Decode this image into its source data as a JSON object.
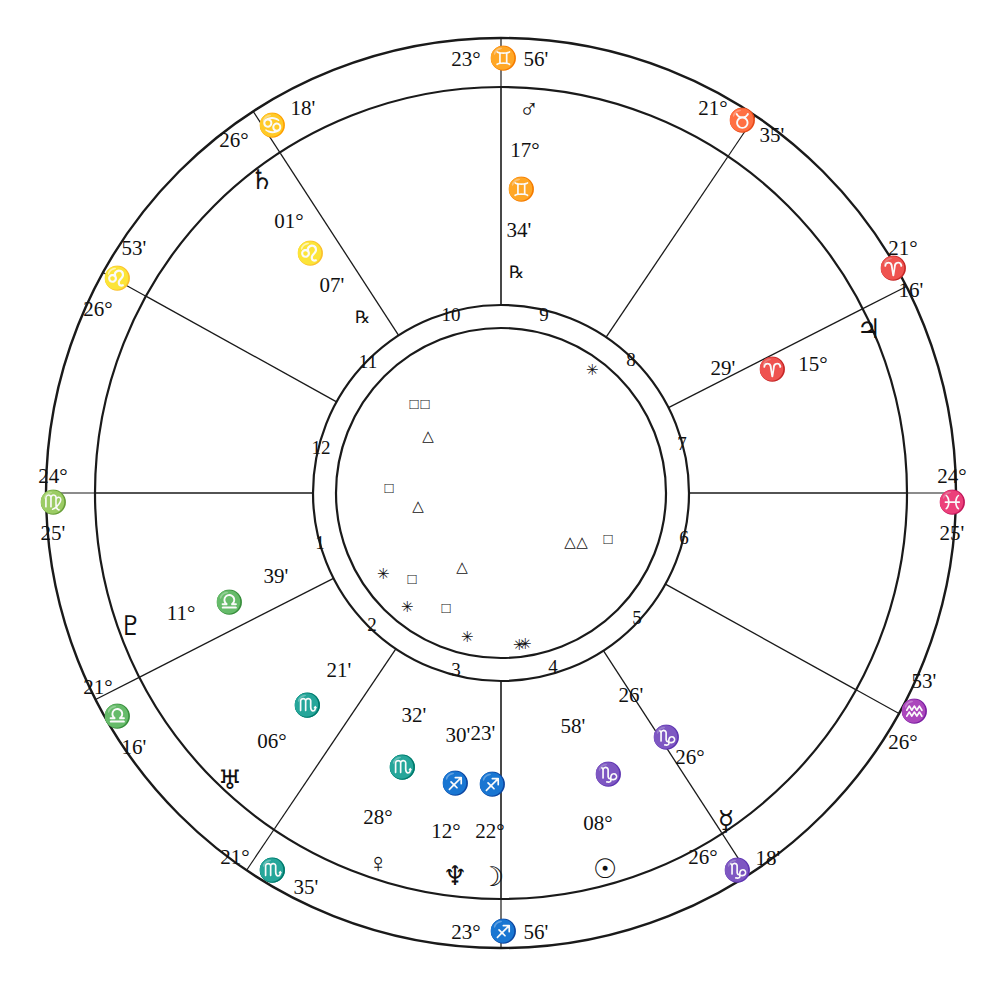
{
  "chart": {
    "type": "astrological-wheel",
    "house_system": "quadrant",
    "stroke_color": "#1a1a1a",
    "background": "#ffffff",
    "degree_symbol": "°",
    "minute_symbol": "'",
    "retrograde_symbol": "℞"
  },
  "signs": {
    "aries": "♈",
    "taurus": "♉",
    "gemini": "♊",
    "cancer": "♋",
    "leo": "♌",
    "virgo": "♍",
    "libra": "♎",
    "scorpio": "♏",
    "sagittarius": "♐",
    "capricorn": "♑",
    "aquarius": "♒",
    "pisces": "♓"
  },
  "planet_glyphs": {
    "sun": "☉",
    "moon": "☽",
    "mercury": "☿",
    "venus": "♀",
    "mars": "♂",
    "jupiter": "♃",
    "saturn": "♄",
    "uranus": "♅",
    "neptune": "♆",
    "pluto": "♇"
  },
  "aspect_glyphs": {
    "square": "□",
    "trine": "△",
    "sextile": "✳",
    "conjunction": "○"
  },
  "cusps": [
    {
      "id": "asc",
      "house": 1,
      "deg": "24°",
      "sign": "♍",
      "min": "25'",
      "angle_deg": 180,
      "label": "24° ♍ 25'"
    },
    {
      "id": "c2",
      "house": 2,
      "deg": "21°",
      "sign": "♎",
      "min": "16'",
      "angle_deg": 207,
      "label": "21° ♎ 16'"
    },
    {
      "id": "c3",
      "house": 3,
      "deg": "21°",
      "sign": "♏",
      "min": "35'",
      "angle_deg": 236,
      "label": "21° ♏ 35'"
    },
    {
      "id": "ic",
      "house": 4,
      "deg": "23°",
      "sign": "♐",
      "min": "56'",
      "angle_deg": 270,
      "label": "23° ♐ 56'"
    },
    {
      "id": "c5",
      "house": 5,
      "deg": "26°",
      "sign": "♑",
      "min": "18'",
      "angle_deg": 303,
      "label": "26° ♑ 18'"
    },
    {
      "id": "c6",
      "house": 6,
      "deg": "26°",
      "sign": "♒",
      "min": "53'",
      "angle_deg": 331,
      "label": "26° ♒ 53'"
    },
    {
      "id": "dsc",
      "house": 7,
      "deg": "24°",
      "sign": "♓",
      "min": "25'",
      "angle_deg": 0,
      "label": "24° ♓ 25'"
    },
    {
      "id": "c8",
      "house": 8,
      "deg": "21°",
      "sign": "♈",
      "min": "16'",
      "angle_deg": 27,
      "label": "21° ♈ 16'"
    },
    {
      "id": "c9",
      "house": 9,
      "deg": "21°",
      "sign": "♉",
      "min": "35'",
      "angle_deg": 56,
      "label": "21° ♉ 35'"
    },
    {
      "id": "mc",
      "house": 10,
      "deg": "23°",
      "sign": "♊",
      "min": "56'",
      "angle_deg": 90,
      "label": "23° ♊ 56'"
    },
    {
      "id": "c11",
      "house": 11,
      "deg": "26°",
      "sign": "♋",
      "min": "18'",
      "angle_deg": 123,
      "label": "26° ♋ 18'"
    },
    {
      "id": "c12",
      "house": 12,
      "deg": "26°",
      "sign": "♌",
      "min": "53'",
      "angle_deg": 151,
      "label": "26° ♌ 53'"
    }
  ],
  "planets": [
    {
      "id": "mars",
      "name": "Mars",
      "glyph": "♂",
      "deg": "17°",
      "sign": "♊",
      "min": "34'",
      "retrograde": true,
      "rx": "℞",
      "x": 529,
      "y": 112,
      "label": "Mars 17° ♊ 34' ℞"
    },
    {
      "id": "saturn",
      "name": "Saturn",
      "glyph": "♄",
      "deg": "01°",
      "sign": "♌",
      "min": "07'",
      "retrograde": true,
      "rx": "℞",
      "x": 262,
      "y": 183,
      "label": "Saturn 01° ♌ 07' ℞"
    },
    {
      "id": "jupiter",
      "name": "Jupiter",
      "glyph": "♃",
      "deg": "15°",
      "sign": "♈",
      "min": "29'",
      "retrograde": false,
      "rx": "",
      "x": 869,
      "y": 332,
      "label": "Jupiter 15° ♈ 29'"
    },
    {
      "id": "pluto",
      "name": "Pluto",
      "glyph": "♇",
      "deg": "11°",
      "sign": "♎",
      "min": "39'",
      "retrograde": false,
      "rx": "",
      "x": 131,
      "y": 629,
      "label": "Pluto 11° ♎ 39'"
    },
    {
      "id": "uranus",
      "name": "Uranus",
      "glyph": "♅",
      "deg": "06°",
      "sign": "♏",
      "min": "21'",
      "retrograde": false,
      "rx": "",
      "x": 230,
      "y": 783,
      "label": "Uranus 06° ♏ 21'"
    },
    {
      "id": "venus",
      "name": "Venus",
      "glyph": "♀",
      "deg": "28°",
      "sign": "♏",
      "min": "32'",
      "retrograde": false,
      "rx": "",
      "x": 378,
      "y": 866,
      "label": "Venus 28° ♏ 32'"
    },
    {
      "id": "neptune",
      "name": "Neptune",
      "glyph": "♆",
      "deg": "12°",
      "sign": "♐",
      "min": "30'",
      "retrograde": false,
      "rx": "",
      "x": 455,
      "y": 879,
      "label": "Neptune 12° ♐ 30'"
    },
    {
      "id": "moon",
      "name": "Moon",
      "glyph": "☽",
      "deg": "22°",
      "sign": "♐",
      "min": "23'",
      "retrograde": false,
      "rx": "",
      "x": 492,
      "y": 880,
      "label": "Moon 22° ♐ 23'"
    },
    {
      "id": "sun",
      "name": "Sun",
      "glyph": "☉",
      "deg": "08°",
      "sign": "♑",
      "min": "58'",
      "retrograde": false,
      "rx": "",
      "x": 605,
      "y": 872,
      "label": "Sun 08° ♑ 58'"
    },
    {
      "id": "mercury",
      "name": "Mercury",
      "glyph": "☿",
      "deg": "26°",
      "sign": "♑",
      "min": "26'",
      "retrograde": false,
      "rx": "",
      "x": 726,
      "y": 824,
      "label": "Mercury 26° ♑ 26'"
    }
  ],
  "planet_text_blocks": [
    {
      "for": "mars",
      "glyph_x": 529,
      "glyph_y": 112,
      "deg_x": 525,
      "deg_y": 152,
      "sign_x": 521,
      "sign_y": 192,
      "min_x": 519,
      "min_y": 232,
      "rx_x": 516,
      "rx_y": 274
    },
    {
      "for": "saturn",
      "glyph_x": 262,
      "glyph_y": 183,
      "deg_x": 289,
      "deg_y": 223,
      "sign_x": 310,
      "sign_y": 256,
      "min_x": 332,
      "min_y": 287,
      "rx_x": 362,
      "rx_y": 319
    },
    {
      "for": "jupiter",
      "glyph_x": 869,
      "glyph_y": 332,
      "deg_x": 813,
      "deg_y": 366,
      "sign_x": 772,
      "sign_y": 372,
      "min_x": 723,
      "min_y": 370,
      "rx_x": 0,
      "rx_y": 0
    },
    {
      "for": "pluto",
      "glyph_x": 131,
      "glyph_y": 629,
      "deg_x": 181,
      "deg_y": 615,
      "sign_x": 229,
      "sign_y": 605,
      "min_x": 276,
      "min_y": 578,
      "rx_x": 0,
      "rx_y": 0
    },
    {
      "for": "uranus",
      "glyph_x": 230,
      "glyph_y": 783,
      "deg_x": 272,
      "deg_y": 743,
      "sign_x": 307,
      "sign_y": 708,
      "min_x": 339,
      "min_y": 672,
      "rx_x": 0,
      "rx_y": 0
    },
    {
      "for": "venus",
      "glyph_x": 378,
      "glyph_y": 866,
      "deg_x": 378,
      "deg_y": 819,
      "sign_x": 402,
      "sign_y": 770,
      "min_x": 414,
      "min_y": 717,
      "rx_x": 0,
      "rx_y": 0
    },
    {
      "for": "neptune",
      "glyph_x": 455,
      "glyph_y": 879,
      "deg_x": 446,
      "deg_y": 833,
      "sign_x": 455,
      "sign_y": 786,
      "min_x": 458,
      "min_y": 737,
      "rx_x": 0,
      "rx_y": 0
    },
    {
      "for": "moon",
      "glyph_x": 492,
      "glyph_y": 880,
      "deg_x": 490,
      "deg_y": 833,
      "sign_x": 492,
      "sign_y": 787,
      "min_x": 483,
      "min_y": 735,
      "rx_x": 0,
      "rx_y": 0
    },
    {
      "for": "sun",
      "glyph_x": 605,
      "glyph_y": 872,
      "deg_x": 598,
      "deg_y": 825,
      "sign_x": 608,
      "sign_y": 777,
      "min_x": 573,
      "min_y": 728,
      "rx_x": 0,
      "rx_y": 0
    },
    {
      "for": "mercury",
      "glyph_x": 726,
      "glyph_y": 824,
      "deg_x": 690,
      "deg_y": 759,
      "sign_x": 666,
      "sign_y": 740,
      "min_x": 631,
      "min_y": 697,
      "rx_x": 0,
      "rx_y": 0
    }
  ],
  "cusp_text_blocks": [
    {
      "for": "asc",
      "deg_x": 53,
      "deg_y": 478,
      "sign_x": 53,
      "sign_y": 505,
      "min_x": 53,
      "min_y": 535
    },
    {
      "for": "dsc",
      "deg_x": 952,
      "deg_y": 478,
      "sign_x": 952,
      "sign_y": 505,
      "min_x": 952,
      "min_y": 535
    },
    {
      "for": "mc",
      "deg_x": 466,
      "deg_y": 61,
      "sign_x": 503,
      "sign_y": 61,
      "min_x": 536,
      "min_y": 61
    },
    {
      "for": "ic",
      "deg_x": 466,
      "deg_y": 934,
      "sign_x": 503,
      "sign_y": 934,
      "min_x": 536,
      "min_y": 934
    },
    {
      "for": "c11",
      "deg_x": 234,
      "deg_y": 142,
      "sign_x": 272,
      "sign_y": 128,
      "min_x": 303,
      "min_y": 110
    },
    {
      "for": "c12",
      "deg_x": 98,
      "deg_y": 311,
      "sign_x": 117,
      "sign_y": 281,
      "min_x": 134,
      "min_y": 250
    },
    {
      "for": "c2",
      "deg_x": 98,
      "deg_y": 689,
      "sign_x": 117,
      "sign_y": 719,
      "min_x": 134,
      "min_y": 749
    },
    {
      "for": "c3",
      "deg_x": 235,
      "deg_y": 859,
      "sign_x": 272,
      "sign_y": 873,
      "min_x": 306,
      "min_y": 889
    },
    {
      "for": "c5",
      "deg_x": 703,
      "deg_y": 859,
      "sign_x": 737,
      "sign_y": 873,
      "min_x": 768,
      "min_y": 860
    },
    {
      "for": "c6",
      "deg_x": 903,
      "deg_y": 744,
      "sign_x": 914,
      "sign_y": 714,
      "min_x": 924,
      "min_y": 683
    },
    {
      "for": "c8",
      "deg_x": 903,
      "deg_y": 250,
      "sign_x": 893,
      "sign_y": 271,
      "min_x": 911,
      "min_y": 292
    },
    {
      "for": "c9",
      "deg_x": 713,
      "deg_y": 110,
      "sign_x": 742,
      "sign_y": 123,
      "min_x": 772,
      "min_y": 137
    }
  ],
  "house_numbers": [
    {
      "num": "1",
      "x": 320,
      "y": 545
    },
    {
      "num": "2",
      "x": 372,
      "y": 627
    },
    {
      "num": "3",
      "x": 456,
      "y": 672
    },
    {
      "num": "4",
      "x": 553,
      "y": 669
    },
    {
      "num": "5",
      "x": 637,
      "y": 620
    },
    {
      "num": "6",
      "x": 684,
      "y": 540
    },
    {
      "num": "7",
      "x": 682,
      "y": 446
    },
    {
      "num": "8",
      "x": 631,
      "y": 362
    },
    {
      "num": "9",
      "x": 544,
      "y": 317
    },
    {
      "num": "10",
      "x": 451,
      "y": 317
    },
    {
      "num": "11",
      "x": 368,
      "y": 364
    },
    {
      "num": "12",
      "x": 321,
      "y": 450
    }
  ],
  "aspect_markers": [
    {
      "glyph": "✳",
      "x": 592,
      "y": 372,
      "type": "sextile"
    },
    {
      "glyph": "□",
      "x": 414,
      "y": 406,
      "type": "square"
    },
    {
      "glyph": "□",
      "x": 425,
      "y": 406,
      "type": "square"
    },
    {
      "glyph": "△",
      "x": 428,
      "y": 438,
      "type": "trine"
    },
    {
      "glyph": "□",
      "x": 389,
      "y": 490,
      "type": "square"
    },
    {
      "glyph": "△",
      "x": 418,
      "y": 508,
      "type": "trine"
    },
    {
      "glyph": "△",
      "x": 462,
      "y": 569,
      "type": "trine"
    },
    {
      "glyph": "✳",
      "x": 383,
      "y": 576,
      "type": "sextile"
    },
    {
      "glyph": "□",
      "x": 412,
      "y": 581,
      "type": "square"
    },
    {
      "glyph": "✳",
      "x": 407,
      "y": 609,
      "type": "sextile"
    },
    {
      "glyph": "□",
      "x": 446,
      "y": 610,
      "type": "square"
    },
    {
      "glyph": "✳",
      "x": 467,
      "y": 639,
      "type": "sextile"
    },
    {
      "glyph": "✳",
      "x": 519,
      "y": 647,
      "type": "sextile"
    },
    {
      "glyph": "✳",
      "x": 525,
      "y": 646,
      "type": "sextile"
    },
    {
      "glyph": "△",
      "x": 570,
      "y": 544,
      "type": "trine"
    },
    {
      "glyph": "△",
      "x": 582,
      "y": 544,
      "type": "trine"
    },
    {
      "glyph": "□",
      "x": 608,
      "y": 541,
      "type": "square"
    }
  ],
  "chart_data": {
    "type": "astrological-wheel",
    "center": {
      "x": 501,
      "y": 493
    },
    "radii": {
      "outer_ring": 455,
      "inner_ring": 405,
      "house_ring_outer": 188,
      "house_ring_inner": 165
    },
    "zodiac_order": [
      "Aries",
      "Taurus",
      "Gemini",
      "Cancer",
      "Leo",
      "Virgo",
      "Libra",
      "Scorpio",
      "Sagittarius",
      "Capricorn",
      "Aquarius",
      "Pisces"
    ],
    "planet_positions": [
      {
        "body": "Sun",
        "degree": 8,
        "sign": "Capricorn",
        "minute": 58,
        "retrograde": false
      },
      {
        "body": "Moon",
        "degree": 22,
        "sign": "Sagittarius",
        "minute": 23,
        "retrograde": false
      },
      {
        "body": "Mercury",
        "degree": 26,
        "sign": "Capricorn",
        "minute": 26,
        "retrograde": false
      },
      {
        "body": "Venus",
        "degree": 28,
        "sign": "Scorpio",
        "minute": 32,
        "retrograde": false
      },
      {
        "body": "Mars",
        "degree": 17,
        "sign": "Gemini",
        "minute": 34,
        "retrograde": true
      },
      {
        "body": "Jupiter",
        "degree": 15,
        "sign": "Aries",
        "minute": 29,
        "retrograde": false
      },
      {
        "body": "Saturn",
        "degree": 1,
        "sign": "Leo",
        "minute": 7,
        "retrograde": true
      },
      {
        "body": "Uranus",
        "degree": 6,
        "sign": "Scorpio",
        "minute": 21,
        "retrograde": false
      },
      {
        "body": "Neptune",
        "degree": 12,
        "sign": "Sagittarius",
        "minute": 30,
        "retrograde": false
      },
      {
        "body": "Pluto",
        "degree": 11,
        "sign": "Libra",
        "minute": 39,
        "retrograde": false
      }
    ],
    "house_cusps": [
      {
        "house": 1,
        "degree": 24,
        "sign": "Virgo",
        "minute": 25,
        "angle": "Ascendant"
      },
      {
        "house": 2,
        "degree": 21,
        "sign": "Libra",
        "minute": 16,
        "angle": ""
      },
      {
        "house": 3,
        "degree": 21,
        "sign": "Scorpio",
        "minute": 35,
        "angle": ""
      },
      {
        "house": 4,
        "degree": 23,
        "sign": "Sagittarius",
        "minute": 56,
        "angle": "IC"
      },
      {
        "house": 5,
        "degree": 26,
        "sign": "Capricorn",
        "minute": 18,
        "angle": ""
      },
      {
        "house": 6,
        "degree": 26,
        "sign": "Aquarius",
        "minute": 53,
        "angle": ""
      },
      {
        "house": 7,
        "degree": 24,
        "sign": "Pisces",
        "minute": 25,
        "angle": "Descendant"
      },
      {
        "house": 8,
        "degree": 21,
        "sign": "Aries",
        "minute": 16,
        "angle": ""
      },
      {
        "house": 9,
        "degree": 21,
        "sign": "Taurus",
        "minute": 35,
        "angle": ""
      },
      {
        "house": 10,
        "degree": 23,
        "sign": "Gemini",
        "minute": 56,
        "angle": "MC"
      },
      {
        "house": 11,
        "degree": 26,
        "sign": "Cancer",
        "minute": 18,
        "angle": ""
      },
      {
        "house": 12,
        "degree": 26,
        "sign": "Leo",
        "minute": 53,
        "angle": ""
      }
    ],
    "aspect_symbol_counts": {
      "square": 6,
      "trine": 5,
      "sextile": 6
    }
  }
}
